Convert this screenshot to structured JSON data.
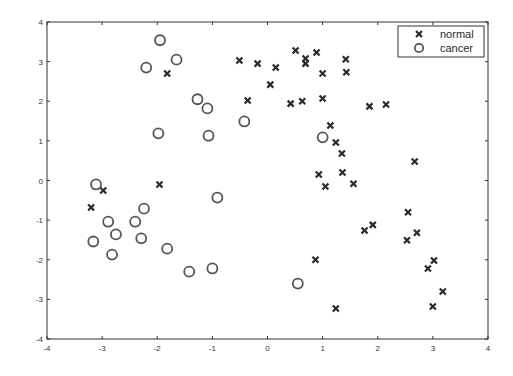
{
  "chart_data": {
    "type": "scatter",
    "title": "",
    "xlabel": "",
    "ylabel": "",
    "xlim": [
      -4,
      4
    ],
    "ylim": [
      -4,
      4
    ],
    "xticks": [
      -4,
      -3,
      -2,
      -1,
      0,
      1,
      2,
      3,
      4
    ],
    "yticks": [
      -4,
      -3,
      -2,
      -1,
      0,
      1,
      2,
      3,
      4
    ],
    "xtick_labels": [
      "-4",
      "-3",
      "-2",
      "-1",
      "0",
      "1",
      "2",
      "3",
      "4"
    ],
    "ytick_labels": [
      "-4",
      "-3",
      "-2",
      "-1",
      "0",
      "1",
      "2",
      "3",
      "4"
    ],
    "grid": false,
    "legend_position": "upper right",
    "series": [
      {
        "name": "normal",
        "marker": "x",
        "color": "#2a2a2a",
        "points": [
          [
            -3.2,
            -0.68
          ],
          [
            -2.98,
            -0.25
          ],
          [
            -1.96,
            -0.1
          ],
          [
            -1.82,
            2.7
          ],
          [
            -0.51,
            3.03
          ],
          [
            -0.36,
            2.02
          ],
          [
            -0.18,
            2.95
          ],
          [
            0.05,
            2.42
          ],
          [
            0.15,
            2.85
          ],
          [
            0.42,
            1.94
          ],
          [
            0.51,
            3.28
          ],
          [
            0.63,
            2.0
          ],
          [
            0.69,
            3.08
          ],
          [
            0.69,
            2.95
          ],
          [
            0.89,
            3.23
          ],
          [
            1.0,
            2.7
          ],
          [
            1.0,
            2.07
          ],
          [
            1.42,
            3.06
          ],
          [
            1.43,
            2.73
          ],
          [
            1.14,
            1.39
          ],
          [
            1.24,
            0.96
          ],
          [
            1.35,
            0.68
          ],
          [
            0.93,
            0.15
          ],
          [
            1.36,
            0.2
          ],
          [
            1.05,
            -0.15
          ],
          [
            1.56,
            -0.08
          ],
          [
            1.85,
            1.87
          ],
          [
            2.15,
            1.92
          ],
          [
            2.67,
            0.48
          ],
          [
            2.55,
            -0.8
          ],
          [
            1.91,
            -1.12
          ],
          [
            1.76,
            -1.26
          ],
          [
            2.71,
            -1.32
          ],
          [
            2.53,
            -1.51
          ],
          [
            3.02,
            -2.02
          ],
          [
            2.91,
            -2.22
          ],
          [
            3.18,
            -2.8
          ],
          [
            3.0,
            -3.18
          ],
          [
            0.87,
            -2.0
          ],
          [
            1.24,
            -3.23
          ]
        ]
      },
      {
        "name": "cancer",
        "marker": "o",
        "color": "#555555",
        "points": [
          [
            -1.95,
            3.54
          ],
          [
            -1.65,
            3.05
          ],
          [
            -2.2,
            2.85
          ],
          [
            -1.27,
            2.05
          ],
          [
            -1.09,
            1.82
          ],
          [
            -0.42,
            1.49
          ],
          [
            -1.98,
            1.19
          ],
          [
            -1.07,
            1.13
          ],
          [
            1.0,
            1.09
          ],
          [
            -3.11,
            -0.1
          ],
          [
            -0.91,
            -0.43
          ],
          [
            -2.24,
            -0.71
          ],
          [
            -2.89,
            -1.04
          ],
          [
            -2.4,
            -1.04
          ],
          [
            -2.75,
            -1.36
          ],
          [
            -3.16,
            -1.54
          ],
          [
            -2.29,
            -1.46
          ],
          [
            -1.82,
            -1.72
          ],
          [
            -2.82,
            -1.87
          ],
          [
            -1.42,
            -2.3
          ],
          [
            -1.0,
            -2.22
          ],
          [
            0.55,
            -2.6
          ]
        ]
      }
    ]
  },
  "legend": {
    "items": [
      {
        "label": "normal",
        "marker": "x"
      },
      {
        "label": "cancer",
        "marker": "o"
      }
    ]
  },
  "colors": {
    "axis": "#333333",
    "normal_marker": "#2a2a2a",
    "cancer_marker": "#555555",
    "background": "#ffffff"
  }
}
